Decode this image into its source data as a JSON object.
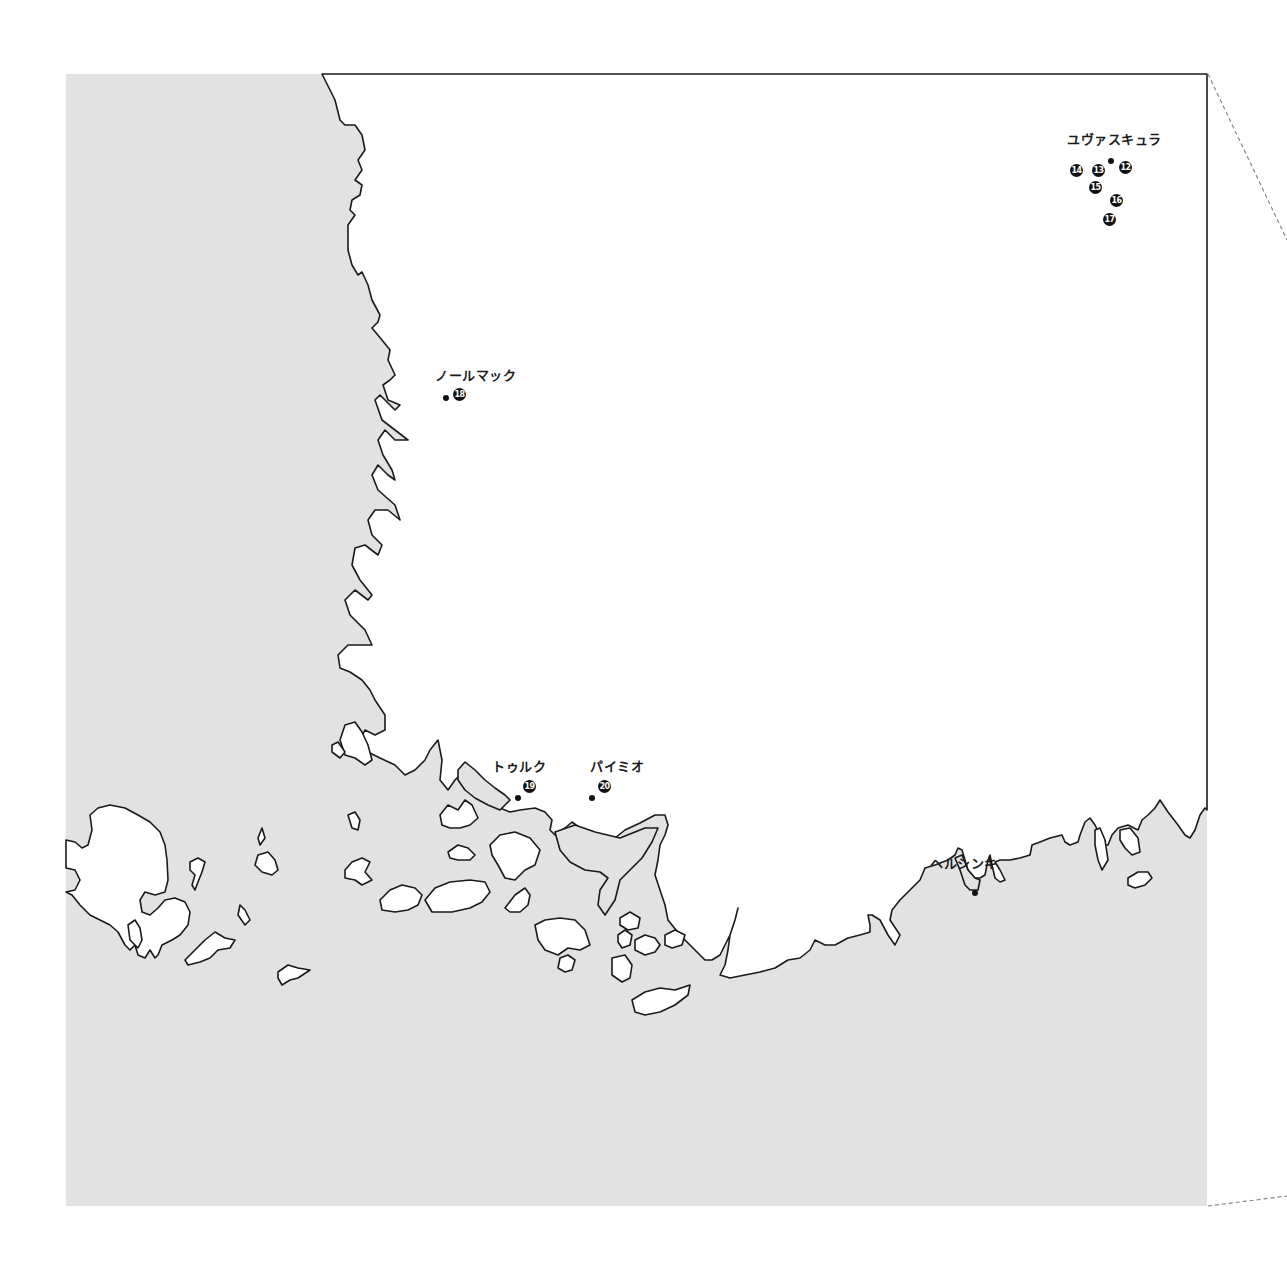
{
  "map": {
    "colors": {
      "sea": "#e2e2e2",
      "land": "#ffffff",
      "coastline": "#1a1a1a",
      "border": "#888888"
    },
    "places": [
      {
        "name": "ユヴァスキュラ",
        "markers": [
          "12",
          "13",
          "14",
          "15",
          "16",
          "17"
        ]
      },
      {
        "name": "ノールマック",
        "markers": [
          "18"
        ]
      },
      {
        "name": "トゥルク",
        "markers": [
          "19"
        ]
      },
      {
        "name": "パイミオ",
        "markers": [
          "20"
        ]
      },
      {
        "name": "ヘルシンキ",
        "markers": []
      }
    ]
  }
}
